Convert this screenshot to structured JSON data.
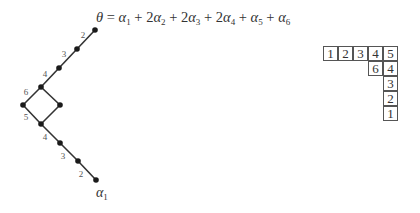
{
  "formula": {
    "lhs": "θ",
    "eq": "=",
    "terms": [
      {
        "coef": "",
        "sym": "α",
        "sub": "1"
      },
      {
        "coef": "2",
        "sym": "α",
        "sub": "2"
      },
      {
        "coef": "2",
        "sym": "α",
        "sub": "3"
      },
      {
        "coef": "2",
        "sym": "α",
        "sub": "4"
      },
      {
        "coef": "",
        "sym": "α",
        "sub": "5"
      },
      {
        "coef": "",
        "sym": "α",
        "sub": "6"
      }
    ],
    "text": "θ = α1 + 2α2 + 2α3 + 2α4 + α5 + α6"
  },
  "graph": {
    "nodes": [
      {
        "id": "n0",
        "x": 95,
        "y": 30
      },
      {
        "id": "n1",
        "x": 77,
        "y": 49
      },
      {
        "id": "n2",
        "x": 59,
        "y": 68
      },
      {
        "id": "n3",
        "x": 41,
        "y": 87
      },
      {
        "id": "n4",
        "x": 23,
        "y": 105
      },
      {
        "id": "n5",
        "x": 60,
        "y": 105
      },
      {
        "id": "n6",
        "x": 41,
        "y": 124
      },
      {
        "id": "n7",
        "x": 60,
        "y": 143
      },
      {
        "id": "n8",
        "x": 78,
        "y": 161
      },
      {
        "id": "n9",
        "x": 96,
        "y": 180
      }
    ],
    "edges": [
      {
        "from": "n0",
        "to": "n1",
        "label": "2",
        "lx": 83,
        "ly": 38
      },
      {
        "from": "n1",
        "to": "n2",
        "label": "3",
        "lx": 64,
        "ly": 57
      },
      {
        "from": "n2",
        "to": "n3",
        "label": "4",
        "lx": 45,
        "ly": 77
      },
      {
        "from": "n3",
        "to": "n4",
        "label": "6",
        "lx": 26,
        "ly": 95
      },
      {
        "from": "n3",
        "to": "n5",
        "label": "",
        "lx": 0,
        "ly": 0
      },
      {
        "from": "n4",
        "to": "n6",
        "label": "5",
        "lx": 26,
        "ly": 120
      },
      {
        "from": "n5",
        "to": "n6",
        "label": "",
        "lx": 0,
        "ly": 0
      },
      {
        "from": "n6",
        "to": "n7",
        "label": "4",
        "lx": 45,
        "ly": 140
      },
      {
        "from": "n7",
        "to": "n8",
        "label": "3",
        "lx": 63,
        "ly": 159
      },
      {
        "from": "n8",
        "to": "n9",
        "label": "2",
        "lx": 81,
        "ly": 177
      }
    ],
    "bottom_label": {
      "sym": "α",
      "sub": "1",
      "x": 96,
      "y": 197
    }
  },
  "tableau": {
    "cell_size": 15,
    "cells": [
      {
        "row": 0,
        "col": 0,
        "value": "1"
      },
      {
        "row": 0,
        "col": 1,
        "value": "2"
      },
      {
        "row": 0,
        "col": 2,
        "value": "3"
      },
      {
        "row": 0,
        "col": 3,
        "value": "4"
      },
      {
        "row": 0,
        "col": 4,
        "value": "5"
      },
      {
        "row": 1,
        "col": 3,
        "value": "6"
      },
      {
        "row": 1,
        "col": 4,
        "value": "4"
      },
      {
        "row": 2,
        "col": 4,
        "value": "3"
      },
      {
        "row": 3,
        "col": 4,
        "value": "2"
      },
      {
        "row": 4,
        "col": 4,
        "value": "1"
      }
    ]
  },
  "colors": {
    "line": "#333333",
    "node": "#1a1a1a",
    "label": "#555555"
  }
}
